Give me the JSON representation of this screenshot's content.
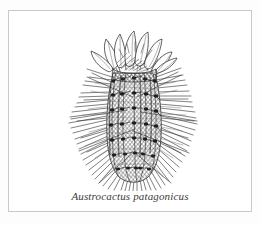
{
  "plate": {
    "caption": "Austrocactus patagonicus",
    "background_color": "#ffffff",
    "frame_color": "#c9c9c9",
    "ink_color": "#303030",
    "caption_color": "#3a3a3a"
  },
  "illustration": {
    "subject": "columnar cactus with terminal flower",
    "technique": "pen-and-ink hatching",
    "parts": [
      {
        "name": "flower",
        "label": "terminal flower with overlapping petals"
      },
      {
        "name": "stem",
        "label": "ribbed columnar stem body"
      },
      {
        "name": "spines",
        "label": "radiating needle spines from areoles"
      },
      {
        "name": "base",
        "label": "tapered lower stem"
      }
    ]
  }
}
